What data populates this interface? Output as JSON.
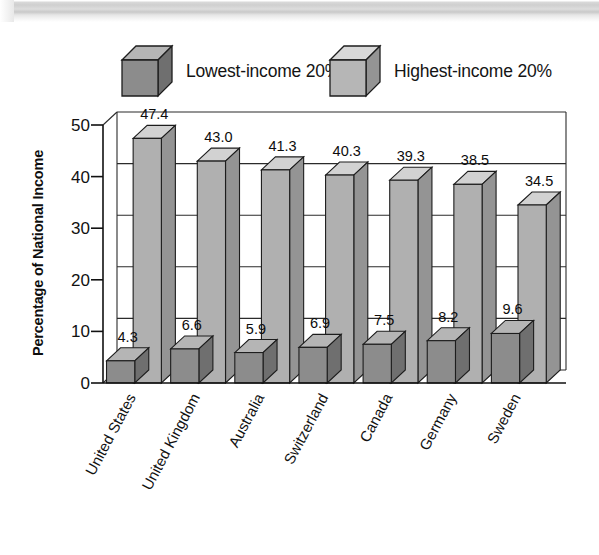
{
  "chart_data": {
    "type": "bar",
    "title": "",
    "subtitle": "",
    "xlabel": "",
    "ylabel": "Percentage of National Income",
    "ylim": [
      0,
      50
    ],
    "yticks": [
      0,
      10,
      20,
      30,
      40,
      50
    ],
    "grid": true,
    "legend_position": "top",
    "three_d": true,
    "categories": [
      "United States",
      "United Kingdom",
      "Australia",
      "Switzerland",
      "Canada",
      "Germany",
      "Sweden"
    ],
    "series": [
      {
        "name": "Lowest-income 20%",
        "color": "#8c8c8c",
        "values": [
          4.3,
          6.6,
          5.9,
          6.9,
          7.5,
          8.2,
          9.6
        ]
      },
      {
        "name": "Highest-income 20%",
        "color": "#b0b0b0",
        "values": [
          47.4,
          43.0,
          41.3,
          40.3,
          39.3,
          38.5,
          34.5
        ]
      }
    ]
  },
  "legend": {
    "items": [
      {
        "label": "Lowest-income 20%",
        "swatch": "dark-cube-icon"
      },
      {
        "label": "Highest-income 20%",
        "swatch": "light-cube-icon"
      }
    ]
  },
  "axes": {
    "y_title": "Percentage of National Income",
    "y_tick_labels": [
      "50",
      "40",
      "30",
      "20",
      "10",
      "0"
    ]
  },
  "value_labels": {
    "lowest": [
      "4.3",
      "6.6",
      "5.9",
      "6.9",
      "7.5",
      "8.2",
      "9.6"
    ],
    "highest": [
      "47.4",
      "43.0",
      "41.3",
      "40.3",
      "39.3",
      "38.5",
      "34.5"
    ]
  },
  "colors": {
    "dark_front": "#8c8c8c",
    "dark_top": "#b5b5b5",
    "dark_side": "#6f6f6f",
    "light_front": "#b0b0b0",
    "light_top": "#d2d2d2",
    "light_side": "#949494",
    "outline": "#1d1d1d",
    "text": "#111111",
    "background": "#ffffff"
  }
}
